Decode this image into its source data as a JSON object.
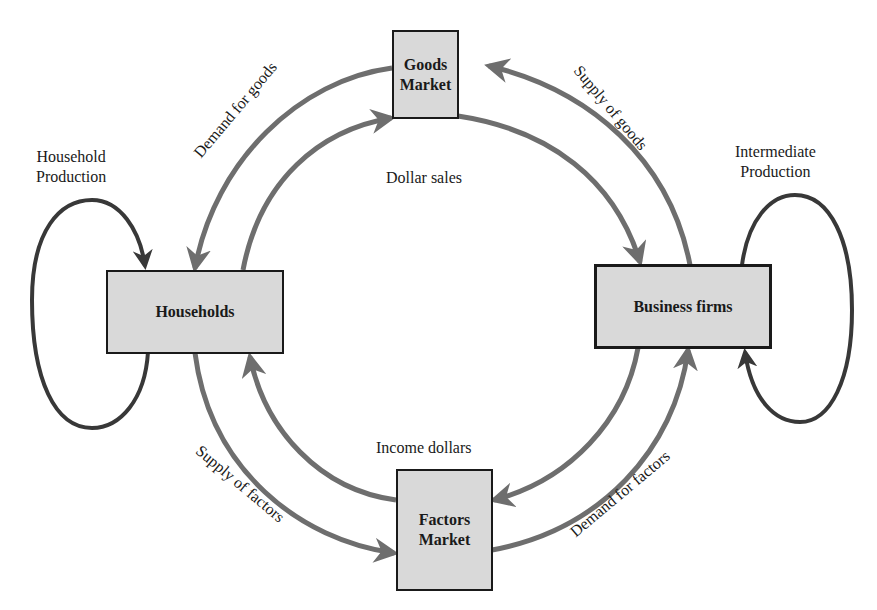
{
  "diagram": {
    "nodes": {
      "goods_market": {
        "label_line1": "Goods",
        "label_line2": "Market"
      },
      "households": {
        "label": "Households"
      },
      "business_firms": {
        "label": "Business firms"
      },
      "factors_market": {
        "label_line1": "Factors",
        "label_line2": "Market"
      }
    },
    "flows": {
      "demand_for_goods": "Demand for goods",
      "supply_of_goods": "Supply of goods",
      "supply_of_factors": "Supply of factors",
      "demand_for_factors": "Demand for factors",
      "dollar_sales": "Dollar sales",
      "income_dollars": "Income dollars"
    },
    "loops": {
      "household_production": {
        "line1": "Household",
        "line2": "Production"
      },
      "intermediate_production": {
        "line1": "Intermediate",
        "line2": "Production"
      }
    },
    "colors": {
      "flow_arrow": "#6e6e6e",
      "loop_arrow": "#383838",
      "box_fill": "#d9d9d9",
      "box_border": "#1a1a1a"
    }
  }
}
